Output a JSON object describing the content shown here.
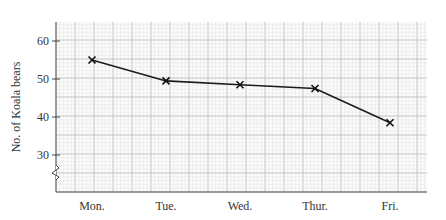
{
  "chart_data": {
    "type": "line",
    "title": "",
    "xlabel": "",
    "ylabel": "No. of Koala bears",
    "categories": [
      "Mon.",
      "Tue.",
      "Wed.",
      "Thur.",
      "Fri."
    ],
    "series": [
      {
        "name": "Koala bears",
        "values": [
          55,
          49.5,
          48.5,
          47.5,
          38.5
        ]
      }
    ],
    "yticks": [
      30,
      40,
      50,
      60
    ],
    "ylim": [
      22,
      65
    ],
    "y_axis_break": true,
    "grid": true,
    "marker": "x",
    "line_color": "#1a1a1a",
    "grid_minor_color": "#e2e2e2",
    "grid_major_color": "#b8b8b8"
  }
}
